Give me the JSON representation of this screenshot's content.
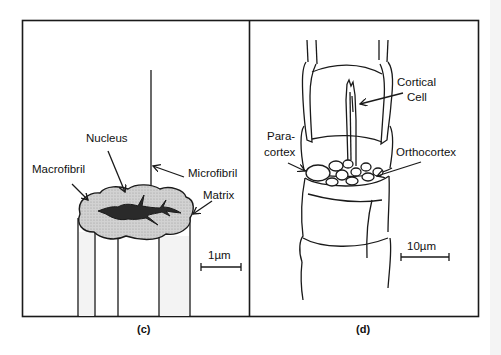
{
  "figure": {
    "panels": [
      {
        "id": "c",
        "caption": "(c)",
        "labels": {
          "nucleus": "Nucleus",
          "macrofibril": "Macrofibril",
          "microfibril": "Microfibril",
          "matrix": "Matrix"
        },
        "scale_bar": "1µm"
      },
      {
        "id": "d",
        "caption": "(d)",
        "labels": {
          "cortical_cell_line1": "Cortical",
          "cortical_cell_line2": "Cell",
          "paracortex_line1": "Para-",
          "paracortex_line2": "cortex",
          "orthocortex": "Orthocortex"
        },
        "scale_bar": "10µm"
      }
    ],
    "colors": {
      "line": "#1a1a1a",
      "matrix_fill": "#c8c8c8",
      "nucleus_fill": "#2a2a2a",
      "background": "#ffffff"
    }
  }
}
